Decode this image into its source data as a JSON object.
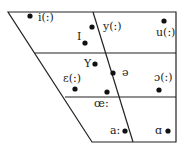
{
  "chart": {
    "title": "",
    "vowels": [
      {
        "id": "i",
        "symbol": "i(:)"
      },
      {
        "id": "y",
        "symbol": "y(:)"
      },
      {
        "id": "u",
        "symbol": "u(:)"
      },
      {
        "id": "ɪ",
        "symbol": "I"
      },
      {
        "id": "ʏ",
        "symbol": "Y"
      },
      {
        "id": "ə",
        "symbol": "ə"
      },
      {
        "id": "ɛ",
        "symbol": "ε(:)"
      },
      {
        "id": "ɔ",
        "symbol": "ɔ(:)"
      },
      {
        "id": "œ",
        "symbol": "œ:"
      },
      {
        "id": "a",
        "symbol": "a:"
      },
      {
        "id": "ɑ",
        "symbol": "ɑ"
      }
    ]
  }
}
